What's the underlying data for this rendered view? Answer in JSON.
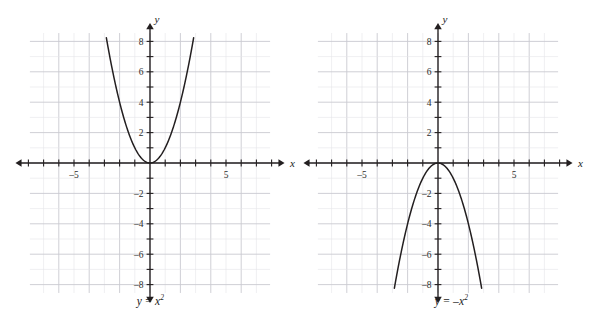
{
  "figure": {
    "background": "#ffffff",
    "panel_count": 2
  },
  "chart_data": [
    {
      "type": "line",
      "title": "y = x²",
      "caption_parts": {
        "lhs": "y",
        "eq": "=",
        "rhs_base": "x",
        "rhs_exp": "2",
        "neg": ""
      },
      "function": "y = x^2",
      "xlabel": "x",
      "ylabel": "y",
      "xlim": [
        -8,
        8
      ],
      "ylim": [
        -8.5,
        8.5
      ],
      "xticks": [
        -8,
        -7,
        -6,
        -5,
        -4,
        -3,
        -2,
        -1,
        0,
        1,
        2,
        3,
        4,
        5,
        6,
        7,
        8
      ],
      "yticks": [
        -8,
        -7,
        -6,
        -5,
        -4,
        -3,
        -2,
        -1,
        0,
        1,
        2,
        3,
        4,
        5,
        6,
        7,
        8
      ],
      "xticklabels": [
        {
          "value": -5,
          "text": "–5"
        },
        {
          "value": 5,
          "text": "5"
        }
      ],
      "yticklabels": [
        {
          "value": 8,
          "text": "8"
        },
        {
          "value": 6,
          "text": "6"
        },
        {
          "value": 4,
          "text": "4"
        },
        {
          "value": 2,
          "text": "2"
        },
        {
          "value": -2,
          "text": "–2"
        },
        {
          "value": -4,
          "text": "–4"
        },
        {
          "value": -6,
          "text": "–6"
        },
        {
          "value": -8,
          "text": "–8"
        }
      ],
      "grid": true,
      "grid_minor_step": 1,
      "grid_major_step": 2,
      "curve_color": "#231f20",
      "curve_domain": [
        -2.87,
        2.87
      ],
      "points": [
        {
          "x": -2.87,
          "y": 8.2
        },
        {
          "x": -2.5,
          "y": 6.25
        },
        {
          "x": -2,
          "y": 4
        },
        {
          "x": -1.5,
          "y": 2.25
        },
        {
          "x": -1,
          "y": 1
        },
        {
          "x": -0.5,
          "y": 0.25
        },
        {
          "x": 0,
          "y": 0
        },
        {
          "x": 0.5,
          "y": 0.25
        },
        {
          "x": 1,
          "y": 1
        },
        {
          "x": 1.5,
          "y": 2.25
        },
        {
          "x": 2,
          "y": 4
        },
        {
          "x": 2.5,
          "y": 6.25
        },
        {
          "x": 2.87,
          "y": 8.2
        }
      ],
      "vertex": {
        "x": 0,
        "y": 0
      },
      "opens": "up"
    },
    {
      "type": "line",
      "title": "y = –x²",
      "caption_parts": {
        "lhs": "y",
        "eq": "=",
        "rhs_base": "x",
        "rhs_exp": "2",
        "neg": "–"
      },
      "function": "y = -x^2",
      "xlabel": "x",
      "ylabel": "y",
      "xlim": [
        -8,
        8
      ],
      "ylim": [
        -8.5,
        8.5
      ],
      "xticks": [
        -8,
        -7,
        -6,
        -5,
        -4,
        -3,
        -2,
        -1,
        0,
        1,
        2,
        3,
        4,
        5,
        6,
        7,
        8
      ],
      "yticks": [
        -8,
        -7,
        -6,
        -5,
        -4,
        -3,
        -2,
        -1,
        0,
        1,
        2,
        3,
        4,
        5,
        6,
        7,
        8
      ],
      "xticklabels": [
        {
          "value": -5,
          "text": "–5"
        },
        {
          "value": 5,
          "text": "5"
        }
      ],
      "yticklabels": [
        {
          "value": 8,
          "text": "8"
        },
        {
          "value": 6,
          "text": "6"
        },
        {
          "value": 4,
          "text": "4"
        },
        {
          "value": 2,
          "text": "2"
        },
        {
          "value": -2,
          "text": "–2"
        },
        {
          "value": -4,
          "text": "–4"
        },
        {
          "value": -6,
          "text": "–6"
        },
        {
          "value": -8,
          "text": "–8"
        }
      ],
      "grid": true,
      "grid_minor_step": 1,
      "grid_major_step": 2,
      "curve_color": "#231f20",
      "curve_domain": [
        -2.87,
        2.87
      ],
      "points": [
        {
          "x": -2.87,
          "y": -8.2
        },
        {
          "x": -2.5,
          "y": -6.25
        },
        {
          "x": -2,
          "y": -4
        },
        {
          "x": -1.5,
          "y": -2.25
        },
        {
          "x": -1,
          "y": -1
        },
        {
          "x": -0.5,
          "y": -0.25
        },
        {
          "x": 0,
          "y": 0
        },
        {
          "x": 0.5,
          "y": -0.25
        },
        {
          "x": 1,
          "y": -1
        },
        {
          "x": 1.5,
          "y": -2.25
        },
        {
          "x": 2,
          "y": -4
        },
        {
          "x": 2.5,
          "y": -6.25
        },
        {
          "x": 2.87,
          "y": -8.2
        }
      ],
      "vertex": {
        "x": 0,
        "y": 0
      },
      "opens": "down"
    }
  ],
  "style": {
    "axis_color": "#231f20",
    "grid_minor_color": "#e4e4e8",
    "grid_major_color": "#c9c9d0",
    "tick_label_color": "#2b2b2b",
    "curve_color": "#231f20"
  }
}
